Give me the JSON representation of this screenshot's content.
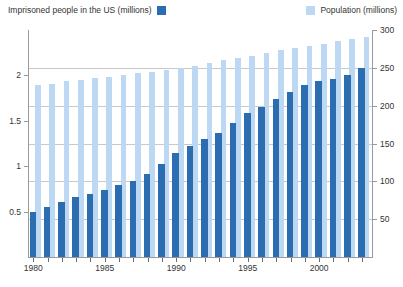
{
  "legend": {
    "series_primary": {
      "label": "Imprisoned people in the US (millions)",
      "color": "#2c6cb0",
      "swatch_name": "imprisoned-swatch"
    },
    "series_secondary": {
      "label": "Population (millions)",
      "color": "#bcd8f2",
      "swatch_name": "population-swatch"
    }
  },
  "axes": {
    "left": {
      "ticks": [
        "0.5",
        "1",
        "1.5",
        "2"
      ],
      "tick_values": [
        0.5,
        1,
        1.5,
        2
      ],
      "min": 0,
      "max": 2.5
    },
    "right": {
      "ticks": [
        "50",
        "100",
        "150",
        "200",
        "250",
        "300"
      ],
      "tick_values": [
        50,
        100,
        150,
        200,
        250,
        300
      ],
      "min": 0,
      "max": 300
    },
    "x": {
      "ticks": [
        "1980",
        "1985",
        "1990",
        "1995",
        "2000"
      ],
      "tick_values": [
        1980,
        1985,
        1990,
        1995,
        2000
      ]
    }
  },
  "chart_data": {
    "type": "bar",
    "title": "",
    "subtitle": "",
    "xlabel": "",
    "ylabel": "Imprisoned people in the US (millions)",
    "ylabel_secondary": "Population (millions)",
    "grid": true,
    "legend_position": "top",
    "ylim": [
      0,
      2.5
    ],
    "ylim_secondary": [
      0,
      300
    ],
    "xlim": [
      1979.5,
      2003.5
    ],
    "categories": [
      "1980",
      "1981",
      "1982",
      "1983",
      "1984",
      "1985",
      "1986",
      "1987",
      "1988",
      "1989",
      "1990",
      "1991",
      "1992",
      "1993",
      "1994",
      "1995",
      "1996",
      "1997",
      "1998",
      "1999",
      "2000",
      "2001",
      "2002",
      "2003"
    ],
    "series": [
      {
        "name": "Imprisoned people in the US (millions)",
        "color": "#2c6cb0",
        "axis": "left",
        "unit": "millions",
        "values": [
          0.5,
          0.55,
          0.61,
          0.66,
          0.69,
          0.74,
          0.79,
          0.84,
          0.91,
          1.02,
          1.15,
          1.22,
          1.3,
          1.37,
          1.48,
          1.59,
          1.65,
          1.74,
          1.82,
          1.89,
          1.94,
          1.96,
          2.0,
          2.08
        ]
      },
      {
        "name": "Population (millions)",
        "color": "#bcd8f2",
        "axis": "right",
        "unit": "millions",
        "values": [
          227,
          229,
          232,
          234,
          236,
          238,
          240,
          243,
          245,
          247,
          250,
          253,
          257,
          260,
          263,
          266,
          269,
          273,
          276,
          279,
          282,
          285,
          288,
          291
        ]
      }
    ]
  }
}
